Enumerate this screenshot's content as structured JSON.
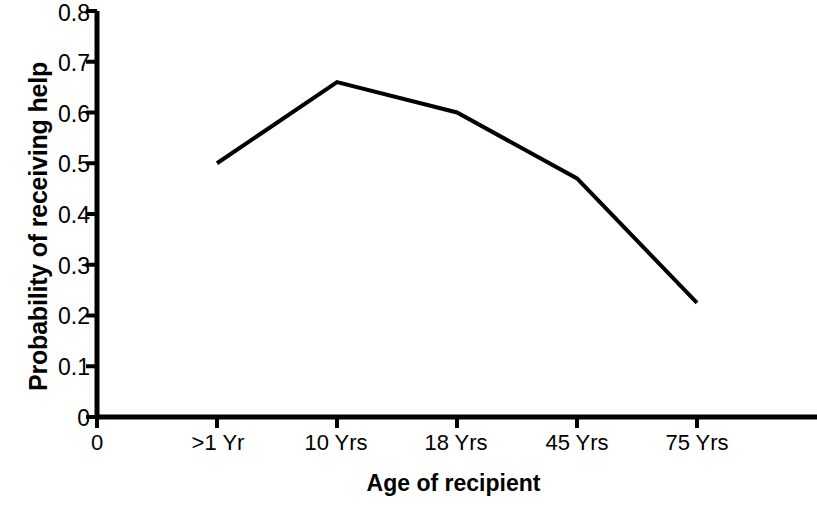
{
  "chart_data": {
    "type": "line",
    "title": "",
    "xlabel": "Age of recipient",
    "ylabel": "Probability of receiving help",
    "categories": [
      "0",
      ">1 Yr",
      "10 Yrs",
      "18 Yrs",
      "45 Yrs",
      "75 Yrs"
    ],
    "x_tick_labels": [
      "0",
      ">1 Yr",
      "10 Yrs",
      "18 Yrs",
      "45 Yrs",
      "75 Yrs"
    ],
    "y_tick_labels": [
      "0.8",
      "0.7",
      "0.6",
      "0.5",
      "0.4",
      "0.3",
      "0.2",
      "0.1",
      "0"
    ],
    "y_tick_values": [
      0.8,
      0.7,
      0.6,
      0.5,
      0.4,
      0.3,
      0.2,
      0.1,
      0
    ],
    "ylim": [
      0,
      0.8
    ],
    "grid": false,
    "legend": false,
    "line_color": "#000000",
    "line_width": 4,
    "series": [
      {
        "name": "Probability of receiving help",
        "points": [
          {
            "x": ">1 Yr",
            "y": 0.5
          },
          {
            "x": "10 Yrs",
            "y": 0.66
          },
          {
            "x": "18 Yrs",
            "y": 0.6
          },
          {
            "x": "45 Yrs",
            "y": 0.47
          },
          {
            "x": "75 Yrs",
            "y": 0.225
          }
        ],
        "values": [
          null,
          0.5,
          0.66,
          0.6,
          0.47,
          0.225
        ]
      }
    ]
  },
  "axes": {
    "y_title": "Probability of receiving help",
    "x_title": "Age of recipient",
    "y_labels": {
      "t0": "0.8",
      "t1": "0.7",
      "t2": "0.6",
      "t3": "0.5",
      "t4": "0.4",
      "t5": "0.3",
      "t6": "0.2",
      "t7": "0.1",
      "t8": "0"
    },
    "x_labels": {
      "t0": "0",
      "t1": ">1 Yr",
      "t2": "10 Yrs",
      "t3": "18 Yrs",
      "t4": "45 Yrs",
      "t5": "75 Yrs"
    }
  }
}
